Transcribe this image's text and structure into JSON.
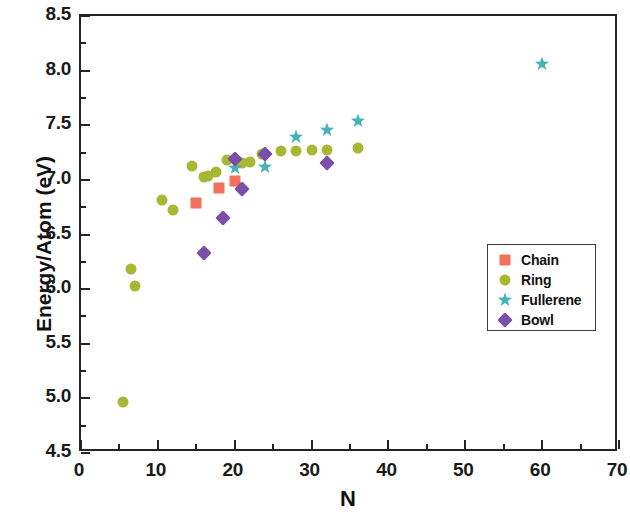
{
  "chart_data": {
    "type": "scatter",
    "title": "",
    "xlabel": "N",
    "ylabel": "Energy/Atom (eV)",
    "xlim": [
      0,
      70
    ],
    "ylim": [
      4.5,
      8.5
    ],
    "xticks": [
      0,
      10,
      20,
      30,
      40,
      50,
      60,
      70
    ],
    "xtick_labels": [
      "0",
      "10",
      "20",
      "30",
      "40",
      "50",
      "60",
      "70"
    ],
    "x_minor_step": 5,
    "yticks": [
      4.5,
      5.0,
      5.5,
      6.0,
      6.5,
      7.0,
      7.5,
      8.0,
      8.5
    ],
    "ytick_labels": [
      "4.5",
      "5.0",
      "5.5",
      "6.0",
      "6.5",
      "7.0",
      "7.5",
      "8.0",
      "8.5"
    ],
    "y_minor_step": 0.25,
    "grid": false,
    "legend_position": "center-right",
    "series": [
      {
        "name": "Chain",
        "marker": "square",
        "color": "#F4705A",
        "points": [
          {
            "x": 15,
            "y": 6.79
          },
          {
            "x": 18,
            "y": 6.93
          },
          {
            "x": 20,
            "y": 6.99
          }
        ]
      },
      {
        "name": "Ring",
        "marker": "circle",
        "color": "#A8B734",
        "points": [
          {
            "x": 5.5,
            "y": 4.97
          },
          {
            "x": 6.5,
            "y": 6.18
          },
          {
            "x": 7,
            "y": 6.03
          },
          {
            "x": 10.5,
            "y": 6.82
          },
          {
            "x": 12,
            "y": 6.72
          },
          {
            "x": 14.5,
            "y": 7.13
          },
          {
            "x": 16,
            "y": 7.03
          },
          {
            "x": 16.5,
            "y": 7.04
          },
          {
            "x": 17.5,
            "y": 7.07
          },
          {
            "x": 19,
            "y": 7.18
          },
          {
            "x": 21,
            "y": 7.15
          },
          {
            "x": 22,
            "y": 7.16
          },
          {
            "x": 23.5,
            "y": 7.24
          },
          {
            "x": 26,
            "y": 7.26
          },
          {
            "x": 28,
            "y": 7.26
          },
          {
            "x": 30,
            "y": 7.27
          },
          {
            "x": 32,
            "y": 7.27
          },
          {
            "x": 36,
            "y": 7.29
          }
        ]
      },
      {
        "name": "Fullerene",
        "marker": "star",
        "color": "#45B3B8",
        "points": [
          {
            "x": 20,
            "y": 7.11
          },
          {
            "x": 24,
            "y": 7.12
          },
          {
            "x": 28,
            "y": 7.39
          },
          {
            "x": 32,
            "y": 7.46
          },
          {
            "x": 36,
            "y": 7.54
          },
          {
            "x": 60,
            "y": 8.06
          }
        ]
      },
      {
        "name": "Bowl",
        "marker": "diamond",
        "color": "#7B4FA8",
        "points": [
          {
            "x": 16,
            "y": 6.33
          },
          {
            "x": 18.5,
            "y": 6.65
          },
          {
            "x": 20,
            "y": 7.19
          },
          {
            "x": 21,
            "y": 6.92
          },
          {
            "x": 24,
            "y": 7.24
          },
          {
            "x": 32,
            "y": 7.15
          }
        ]
      }
    ]
  }
}
